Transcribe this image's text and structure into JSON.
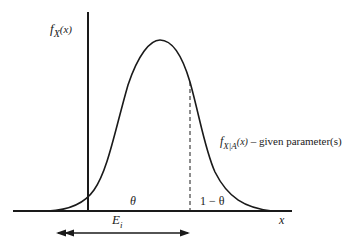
{
  "diagram": {
    "y_axis_label": {
      "base": "f",
      "sub": "X",
      "arg": "(x)"
    },
    "x_axis_label": "x",
    "curve_label": {
      "base": "f",
      "sub": "X|A",
      "arg": "(x)",
      "suffix": " – given parameter(s)"
    },
    "left_region_label": "θ",
    "right_region_label": "1 − θ",
    "interval_label": {
      "base": "E",
      "sub": "i"
    },
    "colors": {
      "ink": "#1a1a1a",
      "background": "#ffffff"
    }
  }
}
